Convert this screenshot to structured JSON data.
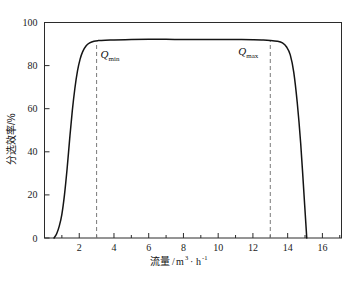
{
  "chart_data": {
    "type": "line",
    "title": "",
    "xlabel": "流量/m³·h⁻¹",
    "ylabel": "分选效率/%",
    "xlabel_parts": {
      "name": "流量",
      "slash": "/",
      "unit_m": "m",
      "unit_m_exp": "3",
      "dot": "·",
      "unit_h": "h",
      "unit_h_exp": "-1"
    },
    "xlim": [
      0,
      17.1
    ],
    "ylim": [
      0,
      100
    ],
    "grid": false,
    "legend": null,
    "x_major_ticks": [
      2,
      4,
      6,
      8,
      10,
      12,
      14,
      16
    ],
    "x_minor_ticks": [
      1,
      3,
      5,
      7,
      9,
      11,
      13,
      15,
      17
    ],
    "y_major_ticks": [
      0,
      20,
      40,
      60,
      80,
      100
    ],
    "x_tick_labels": [
      "2",
      "4",
      "6",
      "8",
      "10",
      "12",
      "14",
      "16"
    ],
    "y_tick_labels": [
      "0",
      "20",
      "40",
      "60",
      "80",
      "100"
    ],
    "series": [
      {
        "name": "分选效率",
        "x": [
          0.55,
          0.7,
          0.85,
          1.0,
          1.15,
          1.3,
          1.45,
          1.6,
          1.75,
          1.9,
          2.05,
          2.2,
          2.4,
          2.6,
          2.85,
          3.1,
          3.5,
          4.0,
          5.0,
          6.0,
          7.0,
          8.0,
          9.0,
          10.0,
          11.0,
          12.0,
          12.6,
          13.0,
          13.4,
          13.7,
          13.95,
          14.15,
          14.35,
          14.55,
          14.75,
          14.95,
          15.1
        ],
        "y": [
          0.0,
          2.0,
          5.5,
          11.0,
          20.0,
          32.0,
          46.0,
          59.0,
          69.5,
          77.5,
          83.0,
          86.5,
          89.2,
          90.5,
          91.3,
          91.6,
          91.8,
          91.9,
          92.1,
          92.2,
          92.2,
          92.1,
          92.1,
          92.1,
          92.1,
          92.0,
          91.9,
          91.7,
          91.3,
          90.5,
          88.5,
          85.0,
          77.0,
          63.0,
          44.0,
          19.0,
          0.0
        ]
      }
    ],
    "annotations": [
      {
        "id": "q-min",
        "symbol": "Q",
        "subscript": "min",
        "x_value": 3,
        "line_from_y": 0,
        "line_to_y": 90.5
      },
      {
        "id": "q-max",
        "symbol": "Q",
        "subscript": "max",
        "x_value": 13,
        "line_from_y": 0,
        "line_to_y": 91.7
      }
    ],
    "colors": {
      "curve": "#141414",
      "axis": "#2b2b2b",
      "guide": "#7a7a7a",
      "background": "#ffffff"
    }
  }
}
